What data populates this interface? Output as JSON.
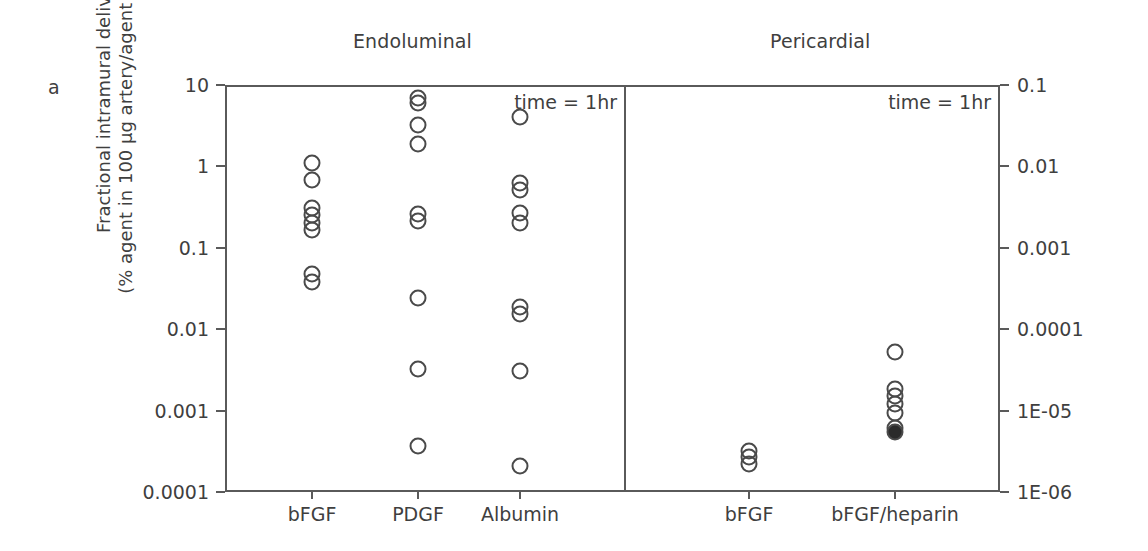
{
  "figure": {
    "letter": "a",
    "y_axis_title_line1": "Fractional intramural delivery",
    "y_axis_title_line2": "(% agent in 100 µg artery/agent delivered)"
  },
  "panels": [
    {
      "id": "endoluminal",
      "title": "Endoluminal",
      "annotation": "time = 1hr",
      "axis_side": "left",
      "categories": [
        "bFGF",
        "PDGF",
        "Albumin"
      ],
      "tick_labels": [
        "10",
        "1",
        "0.1",
        "0.01",
        "0.001",
        "0.0001"
      ],
      "tick_values": [
        10,
        1,
        0.1,
        0.01,
        0.001,
        0.0001
      ]
    },
    {
      "id": "pericardial",
      "title": "Pericardial",
      "annotation": "time = 1hr",
      "axis_side": "right",
      "categories": [
        "bFGF",
        "bFGF/heparin"
      ],
      "tick_labels": [
        "0.1",
        "0.01",
        "0.001",
        "0.0001",
        "1E-05",
        "1E-06"
      ],
      "tick_values": [
        0.1,
        0.01,
        0.001,
        0.0001,
        1e-05,
        1e-06
      ]
    }
  ],
  "chart_data": {
    "type": "scatter",
    "title": "",
    "xlabel": "",
    "ylabel": "Fractional intramural delivery (% agent in 100 µg artery/agent delivered)",
    "yscale": "log",
    "grid": false,
    "legend": "none",
    "panels": [
      {
        "name": "Endoluminal",
        "ylim": [
          0.0001,
          10
        ],
        "ytick_labels": [
          "10",
          "1",
          "0.1",
          "0.01",
          "0.001",
          "0.0001"
        ],
        "annotation": "time = 1hr",
        "series": [
          {
            "name": "bFGF",
            "marker": "open-circle",
            "values": [
              1.1,
              0.68,
              0.31,
              0.25,
              0.2,
              0.165,
              0.047,
              0.038
            ]
          },
          {
            "name": "PDGF",
            "marker": "open-circle",
            "values": [
              6.9,
              6.0,
              3.2,
              1.9,
              0.26,
              0.215,
              0.024,
              0.0032,
              0.00037
            ]
          },
          {
            "name": "Albumin",
            "marker": "open-circle",
            "values": [
              4.1,
              0.62,
              0.52,
              0.27,
              0.2,
              0.019,
              0.0155,
              0.0031,
              0.00021
            ]
          }
        ]
      },
      {
        "name": "Pericardial",
        "ylim": [
          1e-06,
          0.1
        ],
        "ytick_labels": [
          "0.1",
          "0.01",
          "0.001",
          "0.0001",
          "1E-05",
          "1E-06"
        ],
        "annotation": "time = 1hr",
        "series": [
          {
            "name": "bFGF",
            "marker": "open-circle",
            "values": [
              3.2e-06,
              2.7e-06,
              2.2e-06
            ]
          },
          {
            "name": "bFGF/heparin",
            "marker": "open-circle",
            "values": [
              5.2e-05,
              1.85e-05,
              1.52e-05,
              1.22e-05,
              9.4e-06,
              6.1e-06
            ]
          },
          {
            "name": "bFGF/heparin (filled)",
            "marker": "filled-circle",
            "values": [
              5.5e-06
            ]
          }
        ]
      }
    ]
  }
}
